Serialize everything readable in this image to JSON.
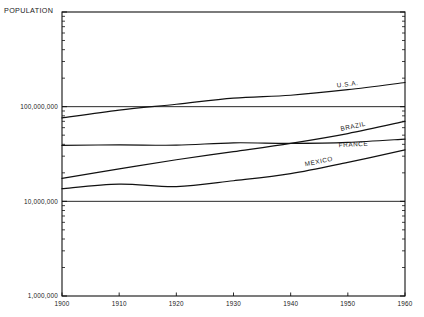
{
  "chart_data": {
    "type": "line",
    "title": "",
    "ylabel": "POPULATION",
    "xlabel": "",
    "scale": "log-y",
    "grid": false,
    "legend_position": "inline-end-of-line",
    "x": [
      1900,
      1910,
      1920,
      1930,
      1940,
      1950,
      1960
    ],
    "xlim": [
      1900,
      1960
    ],
    "ylim": [
      1000000,
      1000000000
    ],
    "xticklabels": [
      "1900",
      "1910",
      "1920",
      "1930",
      "1940",
      "1950",
      "1960"
    ],
    "yticklabels": [
      "1,000,000",
      "10,000,000",
      "100,000,000"
    ],
    "ytickvalues": [
      1000000,
      10000000,
      100000000
    ],
    "series": [
      {
        "name": "U.S.A.",
        "label": "U.S.A.",
        "values": [
          76000000,
          92000000,
          106000000,
          123000000,
          132000000,
          151000000,
          180000000
        ]
      },
      {
        "name": "BRAZIL",
        "label": "BRAZIL",
        "values": [
          17500000,
          22000000,
          27500000,
          33500000,
          41000000,
          52000000,
          70000000
        ]
      },
      {
        "name": "FRANCE",
        "label": "FRANCE",
        "values": [
          39000000,
          39500000,
          39200000,
          41500000,
          41000000,
          42000000,
          45500000
        ]
      },
      {
        "name": "MEXICO",
        "label": "MEXICO",
        "values": [
          13600000,
          15200000,
          14300000,
          16500000,
          19600000,
          25800000,
          34900000
        ]
      }
    ]
  },
  "axis": {
    "population_title": "POPULATION"
  }
}
